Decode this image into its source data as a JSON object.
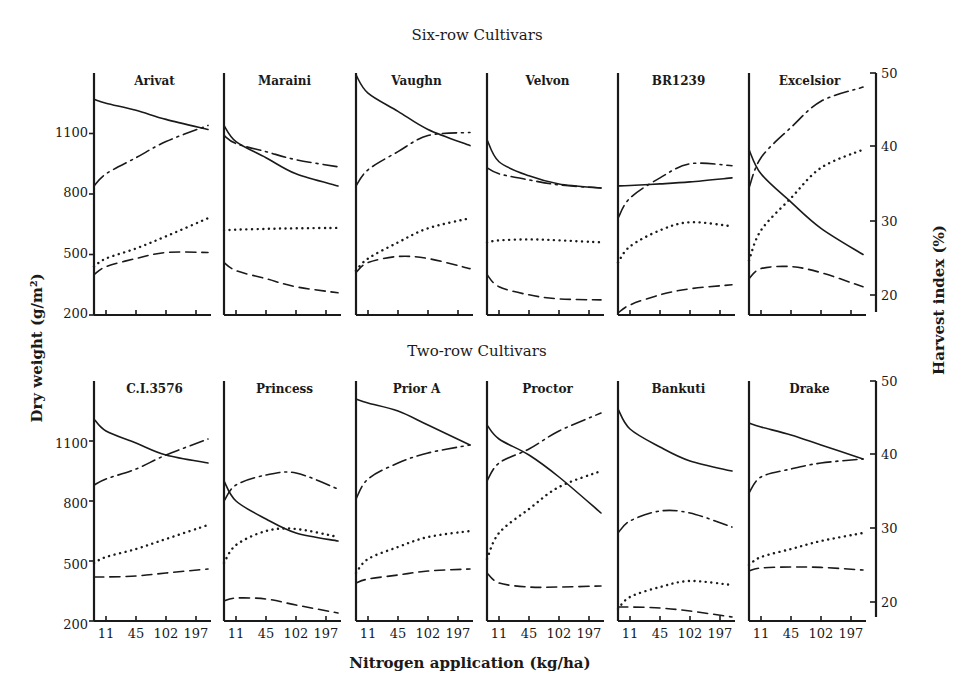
{
  "figure": {
    "section_titles": {
      "top": "Six-row Cultivars",
      "bottom": "Two-row Cultivars"
    },
    "left_axis": {
      "label": "Dry weight (g/m²)",
      "ticks": [
        "200",
        "500",
        "800",
        "1100"
      ],
      "range": [
        200,
        1400
      ]
    },
    "right_axis": {
      "label": "Harvest index (%)",
      "ticks": [
        "20",
        "30",
        "40",
        "50"
      ],
      "range": [
        18,
        50
      ]
    },
    "x_axis": {
      "label": "Nitrogen application (kg/ha)",
      "ticks": [
        "11",
        "45",
        "102",
        "197"
      ]
    }
  },
  "chart_data": {
    "type": "line",
    "xlabel": "Nitrogen application (kg/ha)",
    "ylabel": "Dry weight (g/m²)",
    "ylabel_right": "Harvest index (%)",
    "ylim": [
      200,
      1400
    ],
    "ylim_right": [
      18,
      50
    ],
    "grid": false,
    "legend": "none shown in image",
    "x": [
      0,
      11,
      45,
      102,
      197
    ],
    "x_tick_labels": [
      "",
      "11",
      "45",
      "102",
      "197"
    ],
    "series_styles": [
      "solid",
      "dash-dot",
      "dotted",
      "dashed"
    ],
    "note": "Values read from curve positions on the left (g/m²) axis scale; line-style meanings are not labeled in the image.",
    "panels": [
      {
        "group": "Six-row Cultivars",
        "cultivar": "Arivat",
        "series": [
          {
            "name": "solid",
            "values": [
              1270,
              1250,
              1215,
              1170,
              1120
            ]
          },
          {
            "name": "dash-dot",
            "values": [
              840,
              900,
              980,
              1060,
              1140
            ]
          },
          {
            "name": "dotted",
            "values": [
              440,
              480,
              530,
              590,
              680
            ]
          },
          {
            "name": "dashed",
            "values": [
              400,
              440,
              480,
              510,
              510
            ]
          }
        ]
      },
      {
        "group": "Six-row Cultivars",
        "cultivar": "Maraini",
        "series": [
          {
            "name": "solid",
            "values": [
              1140,
              1060,
              980,
              900,
              840
            ]
          },
          {
            "name": "dash-dot",
            "values": [
              1090,
              1050,
              1010,
              970,
              935
            ]
          },
          {
            "name": "dotted",
            "values": [
              620,
              623,
              627,
              630,
              632
            ]
          },
          {
            "name": "dashed",
            "values": [
              460,
              420,
              380,
              340,
              310
            ]
          }
        ]
      },
      {
        "group": "Six-row Cultivars",
        "cultivar": "Vaughn",
        "series": [
          {
            "name": "solid",
            "values": [
              1390,
              1300,
              1210,
              1120,
              1040
            ]
          },
          {
            "name": "dash-dot",
            "values": [
              840,
              920,
              1010,
              1090,
              1105
            ]
          },
          {
            "name": "dotted",
            "values": [
              420,
              480,
              560,
              630,
              680
            ]
          },
          {
            "name": "dashed",
            "values": [
              410,
              460,
              490,
              480,
              430
            ]
          }
        ]
      },
      {
        "group": "Six-row Cultivars",
        "cultivar": "Velvon",
        "series": [
          {
            "name": "solid",
            "values": [
              1070,
              960,
              890,
              850,
              830
            ]
          },
          {
            "name": "dash-dot",
            "values": [
              930,
              900,
              870,
              845,
              830
            ]
          },
          {
            "name": "dotted",
            "values": [
              560,
              570,
              575,
              570,
              560
            ]
          },
          {
            "name": "dashed",
            "values": [
              400,
              340,
              300,
              280,
              275
            ]
          }
        ]
      },
      {
        "group": "Six-row Cultivars",
        "cultivar": "BR1239",
        "series": [
          {
            "name": "solid",
            "values": [
              840,
              842,
              850,
              860,
              880
            ]
          },
          {
            "name": "dash-dot",
            "values": [
              680,
              780,
              880,
              950,
              940
            ]
          },
          {
            "name": "dotted",
            "values": [
              460,
              540,
              620,
              660,
              640
            ]
          },
          {
            "name": "dashed",
            "values": [
              210,
              250,
              300,
              330,
              350
            ]
          }
        ]
      },
      {
        "group": "Six-row Cultivars",
        "cultivar": "Excelsior",
        "series": [
          {
            "name": "solid",
            "values": [
              1020,
              900,
              760,
              630,
              500
            ]
          },
          {
            "name": "dash-dot",
            "values": [
              830,
              980,
              1130,
              1260,
              1330
            ]
          },
          {
            "name": "dotted",
            "values": [
              470,
              620,
              780,
              930,
              1020
            ]
          },
          {
            "name": "dashed",
            "values": [
              380,
              430,
              440,
              410,
              340
            ]
          }
        ]
      },
      {
        "group": "Two-row Cultivars",
        "cultivar": "C.I.3576",
        "series": [
          {
            "name": "solid",
            "values": [
              1210,
              1150,
              1090,
              1030,
              990
            ]
          },
          {
            "name": "dash-dot",
            "values": [
              880,
              910,
              960,
              1030,
              1110
            ]
          },
          {
            "name": "dotted",
            "values": [
              490,
              520,
              560,
              610,
              680
            ]
          },
          {
            "name": "dashed",
            "values": [
              420,
              420,
              425,
              440,
              460
            ]
          }
        ]
      },
      {
        "group": "Two-row Cultivars",
        "cultivar": "Princess",
        "series": [
          {
            "name": "solid",
            "values": [
              900,
              800,
              710,
              640,
              600
            ]
          },
          {
            "name": "dash-dot",
            "values": [
              800,
              880,
              930,
              940,
              860
            ]
          },
          {
            "name": "dotted",
            "values": [
              490,
              580,
              650,
              660,
              620
            ]
          },
          {
            "name": "dashed",
            "values": [
              300,
              315,
              310,
              280,
              240
            ]
          }
        ]
      },
      {
        "group": "Two-row Cultivars",
        "cultivar": "Prior A",
        "series": [
          {
            "name": "solid",
            "values": [
              1310,
              1290,
              1250,
              1180,
              1080
            ]
          },
          {
            "name": "dash-dot",
            "values": [
              810,
              910,
              990,
              1040,
              1080
            ]
          },
          {
            "name": "dotted",
            "values": [
              440,
              510,
              570,
              620,
              650
            ]
          },
          {
            "name": "dashed",
            "values": [
              390,
              410,
              430,
              450,
              460
            ]
          }
        ]
      },
      {
        "group": "Two-row Cultivars",
        "cultivar": "Proctor",
        "series": [
          {
            "name": "solid",
            "values": [
              1180,
              1110,
              1030,
              920,
              740
            ]
          },
          {
            "name": "dash-dot",
            "values": [
              900,
              990,
              1060,
              1150,
              1240
            ]
          },
          {
            "name": "dotted",
            "values": [
              510,
              640,
              760,
              870,
              950
            ]
          },
          {
            "name": "dashed",
            "values": [
              440,
              390,
              370,
              370,
              375
            ]
          }
        ]
      },
      {
        "group": "Two-row Cultivars",
        "cultivar": "Bankuti",
        "series": [
          {
            "name": "solid",
            "values": [
              1260,
              1160,
              1070,
              1000,
              950
            ]
          },
          {
            "name": "dash-dot",
            "values": [
              640,
              700,
              750,
              740,
              670
            ]
          },
          {
            "name": "dotted",
            "values": [
              260,
              320,
              370,
              400,
              380
            ]
          },
          {
            "name": "dashed",
            "values": [
              270,
              270,
              265,
              250,
              220
            ]
          }
        ]
      },
      {
        "group": "Two-row Cultivars",
        "cultivar": "Drake",
        "series": [
          {
            "name": "solid",
            "values": [
              1190,
              1170,
              1130,
              1080,
              1010
            ]
          },
          {
            "name": "dash-dot",
            "values": [
              840,
              920,
              960,
              990,
              1010
            ]
          },
          {
            "name": "dotted",
            "values": [
              480,
              520,
              560,
              600,
              640
            ]
          },
          {
            "name": "dashed",
            "values": [
              450,
              465,
              470,
              468,
              455
            ]
          }
        ]
      }
    ]
  }
}
